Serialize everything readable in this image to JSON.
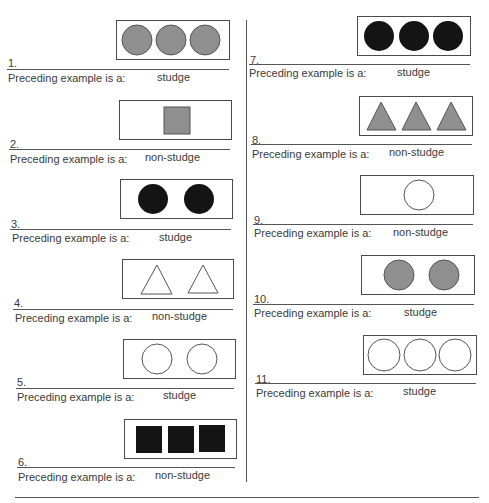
{
  "prompt_label": "Preceding example is a:",
  "colors": {
    "gray_fill": "#8f8f8f",
    "black_fill": "#141414",
    "outline": "#4a4a4a"
  },
  "items": [
    {
      "number": "1.",
      "answer": "studge",
      "shape": "circle",
      "fill": "gray",
      "count": 3
    },
    {
      "number": "2.",
      "answer": "non-studge",
      "shape": "square",
      "fill": "gray",
      "count": 1
    },
    {
      "number": "3.",
      "answer": "studge",
      "shape": "circle",
      "fill": "black",
      "count": 2
    },
    {
      "number": "4.",
      "answer": "non-studge",
      "shape": "triangle",
      "fill": "white",
      "count": 2
    },
    {
      "number": "5.",
      "answer": "studge",
      "shape": "circle",
      "fill": "white",
      "count": 2
    },
    {
      "number": "6.",
      "answer": "non-studge",
      "shape": "square",
      "fill": "black",
      "count": 3
    },
    {
      "number": "7.",
      "answer": "studge",
      "shape": "circle",
      "fill": "black",
      "count": 3
    },
    {
      "number": "8.",
      "answer": "non-studge",
      "shape": "triangle",
      "fill": "gray",
      "count": 3
    },
    {
      "number": "9.",
      "answer": "non-studge",
      "shape": "circle",
      "fill": "white",
      "count": 1
    },
    {
      "number": "10.",
      "answer": "studge",
      "shape": "circle",
      "fill": "gray",
      "count": 2
    },
    {
      "number": "11.",
      "answer": "studge",
      "shape": "circle",
      "fill": "white",
      "count": 3
    }
  ]
}
